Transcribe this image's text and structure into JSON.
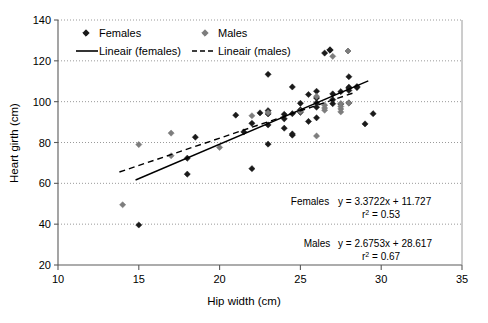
{
  "chart_data": {
    "type": "scatter",
    "title": "",
    "xlabel": "Hip width (cm)",
    "ylabel": "Heart girth (cm)",
    "xlim": [
      10,
      35
    ],
    "ylim": [
      20,
      140
    ],
    "xticks": [
      "10",
      "15",
      "20",
      "25",
      "30",
      "35"
    ],
    "yticks": [
      "20",
      "40",
      "60",
      "80",
      "100",
      "120",
      "140"
    ],
    "grid": "horizontal-dotted",
    "legend_position": "top-left-inside",
    "series": [
      {
        "name": "Females",
        "marker": "filled-diamond",
        "color": "#1a1a1a",
        "points": [
          [
            15.0,
            39.6
          ],
          [
            18.0,
            64.5
          ],
          [
            18.5,
            82.6
          ],
          [
            18.0,
            72.3
          ],
          [
            21.0,
            93.4
          ],
          [
            21.5,
            85.2
          ],
          [
            22.0,
            67.2
          ],
          [
            22.0,
            89.4
          ],
          [
            22.5,
            94.5
          ],
          [
            23.0,
            79.2
          ],
          [
            23.0,
            88.6
          ],
          [
            23.0,
            94.0
          ],
          [
            23.0,
            95.6
          ],
          [
            23.0,
            113.4
          ],
          [
            24.0,
            87.0
          ],
          [
            24.0,
            91.6
          ],
          [
            24.0,
            93.8
          ],
          [
            24.5,
            83.6
          ],
          [
            24.5,
            84.2
          ],
          [
            24.5,
            94.1
          ],
          [
            24.5,
            107.2
          ],
          [
            25.0,
            94.8
          ],
          [
            25.0,
            96.0
          ],
          [
            25.0,
            99.2
          ],
          [
            25.5,
            90.3
          ],
          [
            25.5,
            103.5
          ],
          [
            26.0,
            92.1
          ],
          [
            26.0,
            97.3
          ],
          [
            26.0,
            99.4
          ],
          [
            26.0,
            101.8
          ],
          [
            26.0,
            105.1
          ],
          [
            26.5,
            123.8
          ],
          [
            27.0,
            99.0
          ],
          [
            27.0,
            101.0
          ],
          [
            27.0,
            103.8
          ],
          [
            27.5,
            98.8
          ],
          [
            27.5,
            104.9
          ],
          [
            28.0,
            99.4
          ],
          [
            28.0,
            105.5
          ],
          [
            28.0,
            106.6
          ],
          [
            28.0,
            107.1
          ],
          [
            28.0,
            112.2
          ],
          [
            28.5,
            106.9
          ],
          [
            28.5,
            107.4
          ],
          [
            29.0,
            89.1
          ],
          [
            29.5,
            94.1
          ]
        ]
      },
      {
        "name": "Males",
        "marker": "filled-diamond",
        "color": "#7d7d7d",
        "points": [
          [
            14.0,
            49.5
          ],
          [
            15.0,
            79.0
          ],
          [
            17.0,
            84.6
          ],
          [
            17.0,
            73.5
          ],
          [
            20.0,
            77.6
          ],
          [
            22.0,
            93.1
          ],
          [
            23.0,
            94.6
          ],
          [
            25.0,
            95.2
          ],
          [
            26.0,
            83.2
          ],
          [
            26.0,
            102.6
          ],
          [
            26.5,
            95.8
          ],
          [
            26.5,
            96.9
          ],
          [
            26.5,
            98.3
          ],
          [
            27.0,
            122.2
          ],
          [
            27.5,
            95.0
          ],
          [
            27.5,
            96.4
          ],
          [
            27.5,
            97.6
          ],
          [
            27.5,
            99.1
          ],
          [
            28.0,
            99.3
          ]
        ]
      }
    ],
    "trendlines": [
      {
        "name": "Lineair (females)",
        "style": "solid",
        "color": "#000000",
        "slope": 3.3722,
        "intercept": 11.727,
        "x_start": 14.8,
        "x_end": 29.2,
        "equation": "y = 3.3722x + 11.727",
        "r2_label": "r",
        "r2_sup": "2",
        "r2_value": " = 0.53",
        "legend_prefix": "Females"
      },
      {
        "name": "Lineair (males)",
        "style": "dashed",
        "color": "#000000",
        "slope": 2.6753,
        "intercept": 28.617,
        "x_start": 13.8,
        "x_end": 28.3,
        "equation": "y = 2.6753x + 28.617",
        "r2_label": "r",
        "r2_sup": "2",
        "r2_value": " = 0.67",
        "legend_prefix": "Males"
      }
    ],
    "legend_entries": [
      {
        "label": "Females",
        "kind": "marker",
        "color": "#1a1a1a"
      },
      {
        "label": "Males",
        "kind": "marker",
        "color": "#7d7d7d"
      },
      {
        "label": "Lineair (females)",
        "kind": "solid-line",
        "color": "#000000"
      },
      {
        "label": "Lineair (males)",
        "kind": "dashed-line",
        "color": "#000000"
      }
    ],
    "annotations": [
      {
        "id": "females-eqn",
        "prefix": "Females",
        "equation": "y = 3.3722x + 11.727",
        "r_label": "r",
        "r_sup": "2",
        "r_rest": " = 0.53"
      },
      {
        "id": "males-eqn",
        "prefix": "Males",
        "equation": "y = 2.6753x + 28.617",
        "r_label": "r",
        "r_sup": "2",
        "r_rest": " = 0.67"
      }
    ]
  }
}
